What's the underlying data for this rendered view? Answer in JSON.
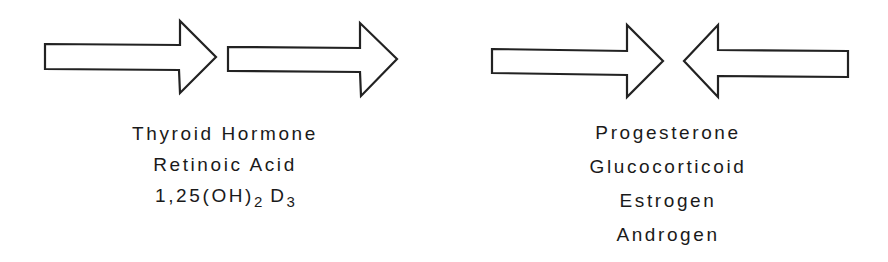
{
  "diagram": {
    "left_group": {
      "arrows": [
        {
          "name": "arrow-right-1",
          "direction": "right"
        },
        {
          "name": "arrow-right-2",
          "direction": "right"
        }
      ],
      "labels": [
        "Thyroid Hormone",
        "Retinoic Acid"
      ],
      "vitamin_label": {
        "prefix": "1,25(OH)",
        "sub1": "2",
        "mid": " D",
        "sub2": "3"
      }
    },
    "right_group": {
      "arrows": [
        {
          "name": "arrow-right-converging",
          "direction": "right"
        },
        {
          "name": "arrow-left-converging",
          "direction": "left"
        }
      ],
      "labels": [
        "Progesterone",
        "Glucocorticoid",
        "Estrogen",
        "Androgen"
      ]
    },
    "colors": {
      "stroke": "#222222",
      "fill": "#ffffff"
    }
  }
}
